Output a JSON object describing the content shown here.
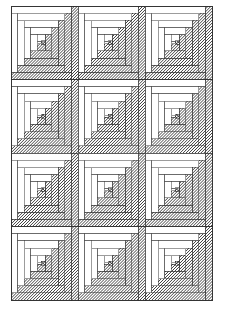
{
  "document": {
    "title": "Log Cabin Quilt Pattern Diagram",
    "type": "quilt-block-layout-drawing",
    "medium": "line drawing with hatched fills"
  },
  "canvas": {
    "width": 225,
    "height": 312,
    "background": "#ffffff"
  },
  "layout": {
    "grid_columns": 3,
    "grid_rows": 4,
    "block_count": 12,
    "origin_x": 11,
    "origin_y": 6,
    "block_width": 67,
    "block_height": 73.5,
    "total_width": 201,
    "total_height": 294,
    "all_blocks_same_orientation": true,
    "block_orientation": "light-logs-top-left dark-logs-bottom-right"
  },
  "block": {
    "name": "log-cabin-block",
    "ring_count": 5,
    "log_width_fraction": 0.0975,
    "center_label": "center-square",
    "light_side": "top-left",
    "dark_side": "bottom-right"
  },
  "fills": {
    "light_log": "#ffffff",
    "light_log_stroke": "#3a3a3a",
    "dark_log_hatch": "#000000",
    "dark_log_base": "#ffffff",
    "center_square_base": "#ffffff",
    "center_square_hatch": "#000000",
    "outline": "#2b2b2b",
    "background": "#ffffff"
  },
  "hatching": {
    "dark_log_pattern": "diagonal-45-lines",
    "dark_log_spacing_px": 2.1,
    "dark_log_line_width": 0.75,
    "center_pattern": "cross-hatch-45",
    "center_spacing_px": 2.1,
    "center_line_width": 0.8
  },
  "strokes": {
    "block_outline_width": 0.55,
    "log_divider_width": 0.5,
    "outer_frame_width": 0.7
  },
  "legend": {
    "light_fabric_label": "light fabric (unshaded)",
    "dark_fabric_label": "dark fabric (hatched)",
    "center_label": "center square (cross-hatched)"
  },
  "blocks": [
    {
      "id": "block-r1-c1",
      "row": 1,
      "col": 1
    },
    {
      "id": "block-r1-c2",
      "row": 1,
      "col": 2
    },
    {
      "id": "block-r1-c3",
      "row": 1,
      "col": 3
    },
    {
      "id": "block-r2-c1",
      "row": 2,
      "col": 1
    },
    {
      "id": "block-r2-c2",
      "row": 2,
      "col": 2
    },
    {
      "id": "block-r2-c3",
      "row": 2,
      "col": 3
    },
    {
      "id": "block-r3-c1",
      "row": 3,
      "col": 1
    },
    {
      "id": "block-r3-c2",
      "row": 3,
      "col": 2
    },
    {
      "id": "block-r3-c3",
      "row": 3,
      "col": 3
    },
    {
      "id": "block-r4-c1",
      "row": 4,
      "col": 1
    },
    {
      "id": "block-r4-c2",
      "row": 4,
      "col": 2
    },
    {
      "id": "block-r4-c3",
      "row": 4,
      "col": 3
    }
  ]
}
